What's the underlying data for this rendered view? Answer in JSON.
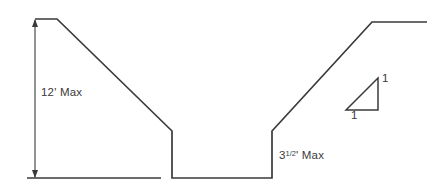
{
  "drawing": {
    "title": "Channel Cross-Section",
    "stroke_color": "#3a3a3a",
    "line_color": "#3a3a3a",
    "text_color": "#3a3a3a",
    "background_color": "#ffffff",
    "width": 435,
    "height": 195
  },
  "labels": {
    "depth_max": "12' Max",
    "bottom_depth_value": "3",
    "bottom_depth_fraction": "1/2",
    "bottom_depth_unit_suffix": "' Max",
    "bottom_depth_full": "3 1/2' Max",
    "slope_vertical": "1",
    "slope_horizontal": "1"
  },
  "geometry": {
    "ground_profile_points": "35,19 57,19 172,131 172,178 272,178 272,131 372,22 427,22",
    "left_ground_line": {
      "x1": 27,
      "y1": 178,
      "x2": 161,
      "y2": 178
    },
    "dimension_line": {
      "x": 35,
      "y_top": 19,
      "y_bottom": 178
    },
    "slope_triangle_points": "346,110 378,110 378,78",
    "notes": {
      "left_slope_description": "cut slope from top-left plateau down to channel wall",
      "right_slope_description": "cut slope from channel wall up to top-right plateau",
      "channel_description": "flat-bottom trapezoidal channel with vertical side walls"
    }
  }
}
